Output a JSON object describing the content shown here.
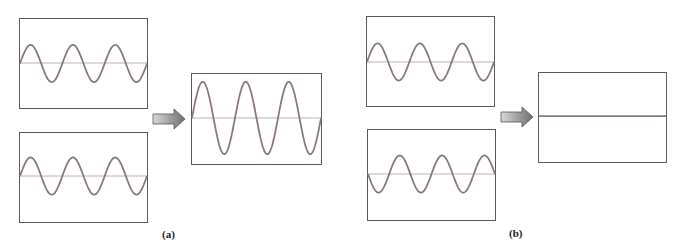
{
  "figure": {
    "colors": {
      "wave": "#8a7680",
      "axis": "#b9b4b6",
      "border": "#5a5a5a",
      "arrow_light": "#d8d8d8",
      "arrow_dark": "#6e6e6e"
    },
    "parts": [
      {
        "id": "a",
        "label": "(a)",
        "title": "Constructive interference",
        "inputs": [
          {
            "cycles": 3,
            "amplitude": 0.6,
            "phase": "in-phase"
          },
          {
            "cycles": 3,
            "amplitude": 0.6,
            "phase": "in-phase"
          }
        ],
        "result": {
          "cycles": 3,
          "amplitude": 0.85,
          "description": "amplified wave"
        }
      },
      {
        "id": "b",
        "label": "(b)",
        "title": "Destructive interference",
        "inputs": [
          {
            "cycles": 3,
            "amplitude": 0.6,
            "phase": "0"
          },
          {
            "cycles": 3,
            "amplitude": 0.6,
            "phase": "180 deg (inverted)"
          }
        ],
        "result": {
          "cycles": 3,
          "amplitude": 0,
          "description": "flat line (cancellation)"
        }
      }
    ]
  }
}
